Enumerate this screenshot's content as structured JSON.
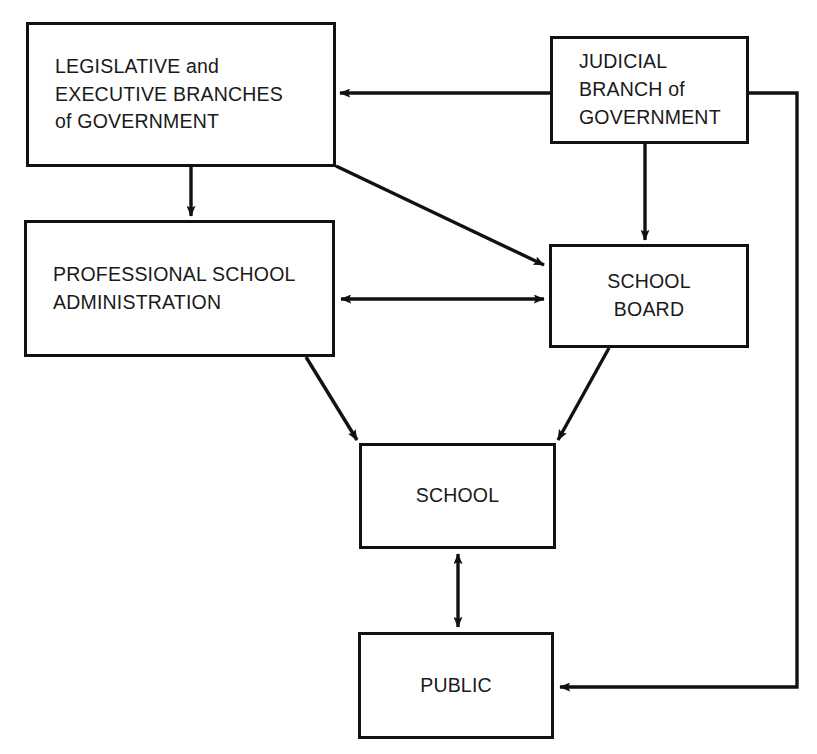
{
  "diagram": {
    "type": "flow-diagram",
    "canvas": {
      "width": 817,
      "height": 754
    },
    "style": {
      "background": "#ffffff",
      "stroke": "#111111",
      "text": "#1a1a1a"
    },
    "nodes": [
      {
        "id": "legislative",
        "label": "LEGISLATIVE and\nEXECUTIVE BRANCHES\nof GOVERNMENT",
        "align": "left"
      },
      {
        "id": "judicial",
        "label": "JUDICIAL\nBRANCH of\nGOVERNMENT",
        "align": "left"
      },
      {
        "id": "admin",
        "label": "PROFESSIONAL SCHOOL\nADMINISTRATION",
        "align": "left"
      },
      {
        "id": "schoolboard",
        "label": "SCHOOL\nBOARD",
        "align": "center"
      },
      {
        "id": "school",
        "label": "SCHOOL",
        "align": "center"
      },
      {
        "id": "public",
        "label": "PUBLIC",
        "align": "center"
      }
    ],
    "edges": [
      {
        "id": "judicial-to-legislative",
        "from": "judicial",
        "to": "legislative",
        "direction": "one-way",
        "shape": "horizontal"
      },
      {
        "id": "legislative-to-admin",
        "from": "legislative",
        "to": "admin",
        "direction": "one-way",
        "shape": "vertical"
      },
      {
        "id": "legislative-to-schoolboard",
        "from": "legislative",
        "to": "schoolboard",
        "direction": "one-way",
        "shape": "diagonal"
      },
      {
        "id": "judicial-to-schoolboard",
        "from": "judicial",
        "to": "schoolboard",
        "direction": "one-way",
        "shape": "vertical"
      },
      {
        "id": "admin-schoolboard",
        "from": "admin",
        "to": "schoolboard",
        "direction": "two-way",
        "shape": "horizontal"
      },
      {
        "id": "admin-to-school",
        "from": "admin",
        "to": "school",
        "direction": "one-way",
        "shape": "diagonal"
      },
      {
        "id": "schoolboard-to-school",
        "from": "schoolboard",
        "to": "school",
        "direction": "one-way",
        "shape": "diagonal"
      },
      {
        "id": "school-public",
        "from": "school",
        "to": "public",
        "direction": "two-way",
        "shape": "vertical"
      },
      {
        "id": "judicial-to-public",
        "from": "judicial",
        "to": "public",
        "direction": "one-way",
        "shape": "orthogonal-right"
      }
    ]
  }
}
